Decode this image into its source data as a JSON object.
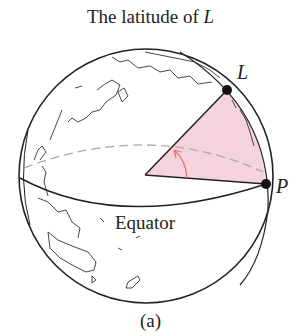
{
  "title": {
    "prefix": "The latitude of ",
    "var": "L"
  },
  "points": {
    "L": {
      "label": "L",
      "x": 227,
      "y": 90
    },
    "P": {
      "label": "P",
      "x": 266,
      "y": 184
    },
    "center": {
      "x": 145,
      "y": 175
    }
  },
  "labels": {
    "equator": "Equator",
    "caption": "(a)"
  },
  "colors": {
    "outline": "#222222",
    "sector_fill": "#f5d3dc",
    "angle_arrow": "#e8706f",
    "dashed_latitude": "#aaaaaa",
    "coastline": "#333333"
  },
  "globe": {
    "cx": 146,
    "cy": 176,
    "r": 127
  }
}
